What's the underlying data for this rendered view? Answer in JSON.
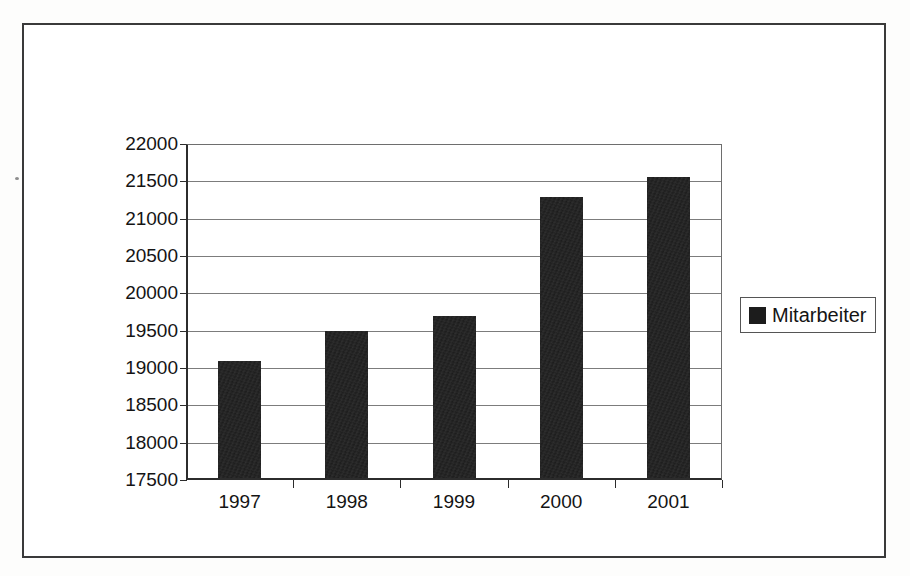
{
  "chart_data": {
    "type": "bar",
    "title": "",
    "xlabel": "",
    "ylabel": "",
    "categories": [
      "1997",
      "1998",
      "1999",
      "2000",
      "2001"
    ],
    "series": [
      {
        "name": "Mitarbeiter",
        "color": "#1c1c1c",
        "values": [
          19100,
          19500,
          19700,
          21290,
          21560
        ]
      }
    ],
    "ylim": [
      17500,
      22000
    ],
    "ytick_step": 500,
    "yticks": [
      17500,
      18000,
      18500,
      19000,
      19500,
      20000,
      20500,
      21000,
      21500,
      22000
    ],
    "ytick_labels": [
      "17500",
      "18000",
      "18500",
      "19000",
      "19500",
      "20000",
      "20500",
      "21000",
      "21500",
      "22000"
    ],
    "grid": true,
    "grid_axis": "y",
    "legend": {
      "visible": true,
      "position": "right",
      "entries": [
        {
          "label": "Mitarbeiter",
          "color": "#1c1c1c",
          "marker": "square"
        }
      ]
    }
  },
  "figure": {
    "border_color": "#3a3a3a",
    "background": "#ffffff",
    "axis_color": "#2c2c2c",
    "gridline_color": "#7c7c7c"
  }
}
